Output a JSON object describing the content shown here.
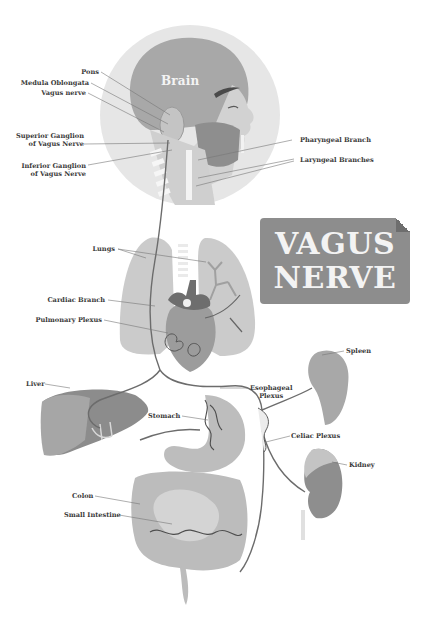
{
  "title": {
    "line1": "VAGUS",
    "line2": "NERVE"
  },
  "head": {
    "brain_label": "Brain"
  },
  "labels": {
    "pons": "Pons",
    "medulla_oblongata": "Medula Oblongata",
    "vagus_nerve": "Vagus nerve",
    "superior_ganglion_line1": "Superior Ganglion",
    "superior_ganglion_line2": "of Vagus Nerve",
    "inferior_ganglion_line1": "Inferior Ganglion",
    "inferior_ganglion_line2": "of Vagus Nerve",
    "pharyngeal_branch": "Pharyngeal Branch",
    "laryngeal_branches": "Laryngeal Branches",
    "lungs": "Lungs",
    "cardiac_branch": "Cardiac Branch",
    "pulmonary_plexus": "Pulmonary Plexus",
    "liver": "Liver",
    "stomach": "Stomach",
    "esophageal_plexus_line1": "Esophageal",
    "esophageal_plexus_line2": "Plexus",
    "spleen": "Spleen",
    "celiac_plexus": "Celiac Plexus",
    "kidney": "Kidney",
    "colon": "Colon",
    "small_intestine": "Small Intestine"
  },
  "colors": {
    "background": "#ffffff",
    "head_circle": "#e4e4e4",
    "organ_light": "#c9c9c9",
    "organ_mid": "#a9a9a9",
    "organ_dark": "#7a7a7a",
    "nerve": "#6a6a6a",
    "banner": "#8d8d8d",
    "label_text": "#3a3a3a"
  }
}
